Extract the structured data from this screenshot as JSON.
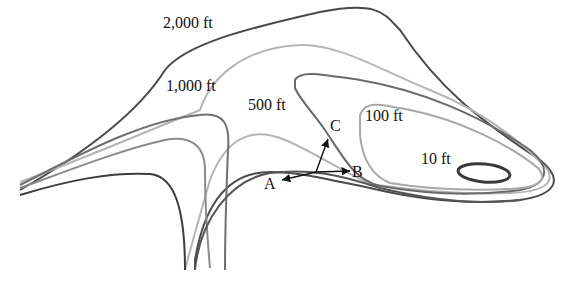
{
  "diagram": {
    "type": "contour-map",
    "contours": [
      {
        "label": "2,000 ft",
        "color": "#4a4a4a"
      },
      {
        "label": "1,000 ft",
        "color": "#b0b0b0"
      },
      {
        "label": "500 ft",
        "color": "#6a6a6a"
      },
      {
        "label": "100 ft",
        "color": "#a8a8a8"
      },
      {
        "label": "10 ft",
        "color": "#3a3a3a"
      }
    ],
    "points": [
      {
        "label": "A"
      },
      {
        "label": "B"
      },
      {
        "label": "C"
      }
    ]
  }
}
